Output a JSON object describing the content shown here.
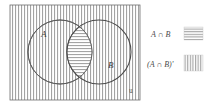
{
  "figure": {
    "type": "venn-diagram",
    "title": "",
    "universe_symbol": "u",
    "background_color": "#ffffff",
    "stroke_color": "#555555",
    "hatch_color": "#999999"
  },
  "sets": [
    {
      "id": "A",
      "label": "A",
      "cx": 60,
      "cy": 52,
      "r": 32
    },
    {
      "id": "B",
      "label": "B",
      "cx": 99,
      "cy": 52,
      "r": 32
    }
  ],
  "regions": [
    {
      "id": "intersection",
      "label": "A ∩ B",
      "fill_pattern": "horizontal-hatch"
    },
    {
      "id": "complement",
      "label": "(A ∩ B)'",
      "fill_pattern": "vertical-hatch"
    }
  ],
  "legend": {
    "position": "right",
    "items": [
      {
        "label": "A ∩ B",
        "pattern": "horizontal-hatch"
      },
      {
        "label": "(A ∩ B)'",
        "pattern": "vertical-hatch"
      }
    ]
  },
  "universe": {
    "rect": {
      "x": 10,
      "y": 5,
      "width": 130,
      "height": 95
    },
    "label": "u",
    "fill_pattern": "vertical-hatch"
  }
}
